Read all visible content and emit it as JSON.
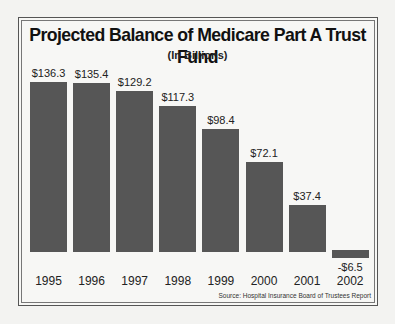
{
  "chart_data": {
    "type": "bar",
    "title": "Projected Balance of Medicare Part A Trust Fund",
    "subtitle": "(In Billions)",
    "xlabel": "",
    "ylabel": "",
    "categories": [
      "1995",
      "1996",
      "1997",
      "1998",
      "1999",
      "2000",
      "2001",
      "2002"
    ],
    "values": [
      136.3,
      135.4,
      129.2,
      117.3,
      98.4,
      72.1,
      37.4,
      -6.5
    ],
    "value_labels": [
      "$136.3",
      "$135.4",
      "$129.2",
      "$117.3",
      "$98.4",
      "$72.1",
      "$37.4",
      "-$6.5"
    ],
    "ylim": [
      -6.5,
      136.3
    ],
    "grid": false,
    "legend": null,
    "annotations": [
      "Source: Hospital Insurance Board of Trustees Report"
    ],
    "bar_color": "#565656"
  },
  "source": "Source: Hospital Insurance Board of Trustees Report"
}
